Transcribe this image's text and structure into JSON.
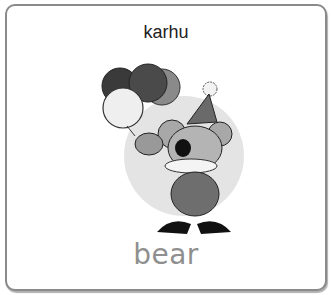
{
  "card": {
    "foreign_word": "karhu",
    "english_word": "bear",
    "illustration": "clown-koala-bear-with-balloons"
  }
}
